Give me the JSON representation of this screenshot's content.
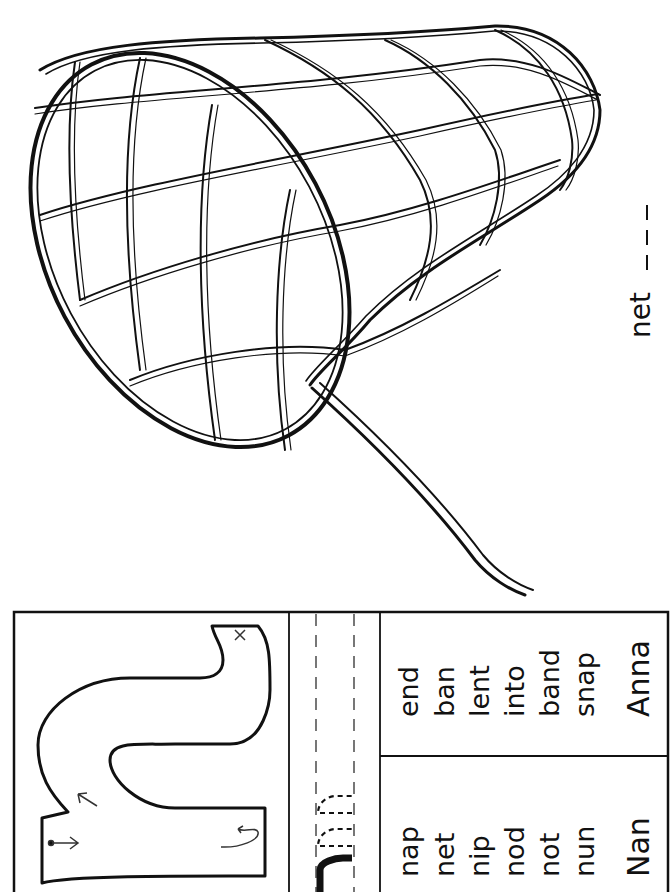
{
  "page": {
    "orientation": "rotated-90-ccw",
    "colors": {
      "ink": "#111111",
      "paper": "#ffffff",
      "guide": "#555555"
    }
  },
  "picture": {
    "subject": "butterfly net",
    "icon": "net-illustration",
    "caption_word": "net",
    "caption_blanks": "_ _ _"
  },
  "letter_box": {
    "letter": "n",
    "stroke_guides": [
      "start-dot-arrow",
      "up-arrow",
      "curve-arrow",
      "end-x"
    ]
  },
  "tracing_row": {
    "solid_letter": "n",
    "dotted_letters": [
      "n",
      "n"
    ]
  },
  "word_lists": {
    "column_1": [
      "nap",
      "net",
      "nip",
      "nod",
      "not",
      "nun"
    ],
    "column_1_name": "Nan",
    "column_2": [
      "end",
      "ban",
      "lent",
      "into",
      "band",
      "snap"
    ],
    "column_2_name": "Anna"
  }
}
